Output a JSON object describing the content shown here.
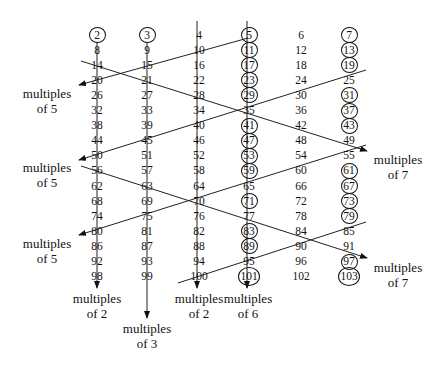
{
  "diagram": {
    "columns": [
      {
        "index": 1,
        "values": [
          "2",
          "8",
          "14",
          "20",
          "26",
          "32",
          "38",
          "44",
          "50",
          "56",
          "62",
          "68",
          "74",
          "80",
          "86",
          "92",
          "98"
        ],
        "arrow_label": [
          "multiples",
          "of 2"
        ]
      },
      {
        "index": 2,
        "values": [
          "3",
          "9",
          "15",
          "21",
          "27",
          "33",
          "39",
          "45",
          "51",
          "57",
          "63",
          "69",
          "75",
          "81",
          "87",
          "93",
          "99"
        ],
        "arrow_label": [
          "multiples",
          "of 3"
        ]
      },
      {
        "index": 3,
        "values": [
          "4",
          "10",
          "16",
          "22",
          "28",
          "34",
          "40",
          "46",
          "52",
          "58",
          "64",
          "70",
          "76",
          "82",
          "88",
          "94",
          "100"
        ],
        "arrow_label": [
          "multiples",
          "of 2"
        ]
      },
      {
        "index": 4,
        "values": [
          "5",
          "11",
          "17",
          "23",
          "29",
          "35",
          "41",
          "47",
          "53",
          "59",
          "65",
          "71",
          "77",
          "83",
          "89",
          "95",
          "101"
        ],
        "arrow_label": null
      },
      {
        "index": 5,
        "values": [
          "6",
          "12",
          "18",
          "24",
          "30",
          "36",
          "42",
          "48",
          "54",
          "60",
          "66",
          "72",
          "78",
          "84",
          "90",
          "96",
          "102"
        ],
        "arrow_label": [
          "multiples",
          "of 6"
        ]
      },
      {
        "index": 6,
        "values": [
          "7",
          "13",
          "19",
          "25",
          "31",
          "37",
          "43",
          "49",
          "55",
          "61",
          "67",
          "73",
          "79",
          "85",
          "91",
          "97",
          "103"
        ],
        "arrow_label": null
      }
    ],
    "circled_primes": [
      "2",
      "3",
      "5",
      "7",
      "11",
      "13",
      "17",
      "19",
      "23",
      "29",
      "31",
      "37",
      "41",
      "43",
      "47",
      "53",
      "59",
      "61",
      "67",
      "71",
      "73",
      "79",
      "83",
      "89",
      "97",
      "101",
      "103"
    ],
    "side_labels": {
      "left": [
        {
          "line1": "multiples",
          "line2": "of 5"
        },
        {
          "line1": "multiples",
          "line2": "of 5"
        },
        {
          "line1": "multiples",
          "line2": "of 5"
        }
      ],
      "right": [
        {
          "line1": "multiples",
          "line2": "of 7"
        },
        {
          "line1": "multiples",
          "line2": "of 7"
        }
      ]
    },
    "bottom_labels": [
      {
        "line1": "multiples",
        "line2": "of 2"
      },
      {
        "line1": "multiples",
        "line2": "of 3"
      },
      {
        "line1": "multiples",
        "line2": "of 2"
      },
      {
        "line1": "multiples",
        "line2": "of 6"
      }
    ]
  }
}
